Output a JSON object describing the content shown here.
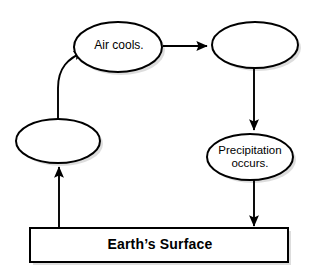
{
  "diagram": {
    "type": "cycle-flowchart",
    "canvas": {
      "width": 313,
      "height": 277
    },
    "colors": {
      "stroke": "#000000",
      "fill": "#ffffff",
      "shadow": "#b4b4b4",
      "text": "#000000",
      "background": "#ffffff"
    },
    "nodes": [
      {
        "id": "blank-left",
        "shape": "ellipse",
        "label": "",
        "filled_in": false,
        "cx": 58,
        "cy": 141,
        "rx": 42,
        "ry": 22
      },
      {
        "id": "air-cools",
        "shape": "ellipse",
        "label": "Air cools.",
        "filled_in": true,
        "cx": 118,
        "cy": 47,
        "rx": 44,
        "ry": 25
      },
      {
        "id": "blank-top-right",
        "shape": "ellipse",
        "label": "",
        "filled_in": false,
        "cx": 255,
        "cy": 45,
        "rx": 43,
        "ry": 23
      },
      {
        "id": "precipitation-occurs",
        "shape": "ellipse",
        "label": "Precipitation\noccurs.",
        "filled_in": true,
        "cx": 250,
        "cy": 157,
        "rx": 43,
        "ry": 23
      },
      {
        "id": "earths-surface",
        "shape": "rectangle",
        "label": "Earth’s Surface",
        "filled_in": true,
        "x": 30,
        "y": 228,
        "width": 258,
        "height": 34
      }
    ],
    "edges": [
      {
        "id": "edge-surface-to-blank-left",
        "from": "earths-surface",
        "to": "blank-left",
        "style": "straight-vertical",
        "direction": "up"
      },
      {
        "id": "edge-blank-left-to-air-cools",
        "from": "blank-left",
        "to": "air-cools",
        "style": "curved",
        "direction": "up-right"
      },
      {
        "id": "edge-air-cools-to-blank-top-right",
        "from": "air-cools",
        "to": "blank-top-right",
        "style": "straight-horizontal",
        "direction": "right"
      },
      {
        "id": "edge-blank-top-right-to-precipitation",
        "from": "blank-top-right",
        "to": "precipitation-occurs",
        "style": "straight-vertical",
        "direction": "down"
      },
      {
        "id": "edge-precipitation-to-surface",
        "from": "precipitation-occurs",
        "to": "earths-surface",
        "style": "straight-vertical",
        "direction": "down"
      }
    ]
  }
}
